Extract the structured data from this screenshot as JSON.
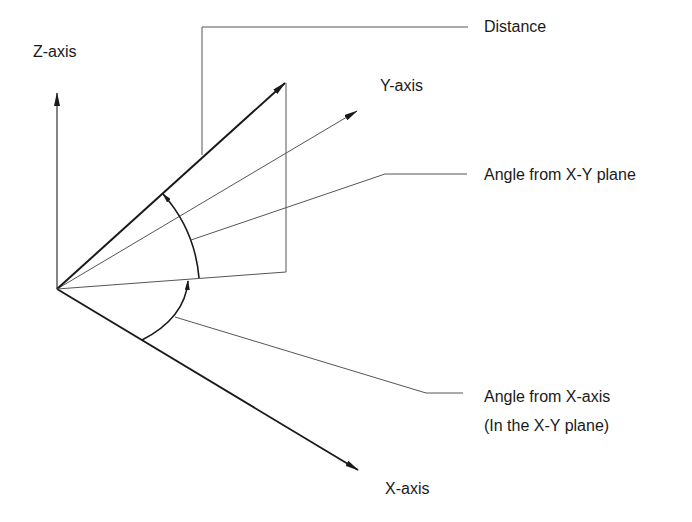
{
  "diagram": {
    "axes": {
      "z": {
        "label": "Z-axis"
      },
      "y": {
        "label": "Y-axis"
      },
      "x": {
        "label": "X-axis"
      }
    },
    "callouts": {
      "distance": {
        "label": "Distance"
      },
      "angle_xy_plane": {
        "label": "Angle from X-Y plane"
      },
      "angle_x_axis": {
        "line1": "Angle from X-axis",
        "line2": "(In the X-Y plane)"
      }
    },
    "colors": {
      "line": "#1a1a1a",
      "thin_line": "#555555",
      "background": "#ffffff"
    }
  }
}
